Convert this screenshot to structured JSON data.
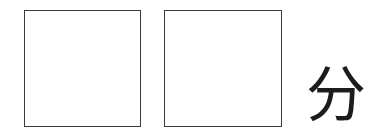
{
  "page": {
    "background_color": "#ffffff",
    "ink_color": "#1c1c1c",
    "border_color": "#3a3a3a",
    "width": 387,
    "height": 136
  },
  "answer_boxes": [
    {
      "name": "answer-box-1",
      "value": "",
      "placeholder": ""
    },
    {
      "name": "answer-box-2",
      "value": "",
      "placeholder": ""
    }
  ],
  "unit": {
    "label": "分"
  }
}
